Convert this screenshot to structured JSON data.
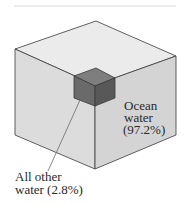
{
  "diagram": {
    "colors": {
      "rule": "#d8d8d8",
      "big_top": "#ebebeb",
      "big_left": "#dcdcdc",
      "big_right": "#d4d4d4",
      "small_top": "#7e7e7e",
      "small_left": "#6a6a6a",
      "small_right": "#585858",
      "edge": "#3a3a3a"
    },
    "labels": {
      "ocean": {
        "line1": "Ocean",
        "line2": "water",
        "line3": "(97.2%)"
      },
      "other": {
        "line1": "All other",
        "line2": "water (2.8%)"
      }
    },
    "values": [
      {
        "name": "Ocean water",
        "percent": 97.2
      },
      {
        "name": "All other water",
        "percent": 2.8
      }
    ]
  }
}
